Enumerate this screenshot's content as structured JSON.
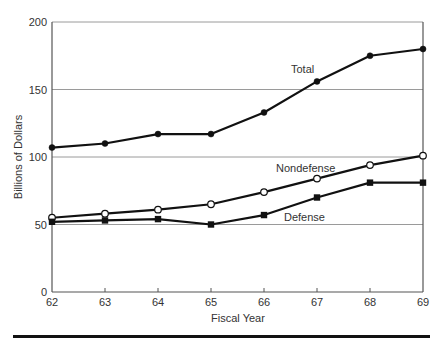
{
  "chart_data": {
    "type": "line",
    "title": "",
    "xlabel": "Fiscal Year",
    "ylabel": "Billions of Dollars",
    "x": [
      "62",
      "63",
      "64",
      "65",
      "66",
      "67",
      "68",
      "69"
    ],
    "ylim": [
      0,
      200
    ],
    "yticks": [
      "0",
      "50",
      "100",
      "150",
      "200"
    ],
    "grid": "horizontal",
    "legend": "inline labels",
    "series": [
      {
        "name": "Total",
        "marker": "filled-circle",
        "values": [
          107,
          110,
          117,
          117,
          133,
          156,
          175,
          180
        ]
      },
      {
        "name": "Nondefense",
        "marker": "open-circle",
        "values": [
          55,
          58,
          61,
          65,
          74,
          84,
          94,
          101
        ]
      },
      {
        "name": "Defense",
        "marker": "filled-square",
        "values": [
          52,
          53,
          54,
          50,
          57,
          70,
          81,
          81
        ]
      }
    ]
  },
  "labels": {
    "ylabel": "Billions of Dollars",
    "xlabel": "Fiscal Year",
    "total": "Total",
    "nondefense": "Nondefense",
    "defense": "Defense",
    "y0": "0",
    "y50": "50",
    "y100": "100",
    "y150": "150",
    "y200": "200",
    "x62": "62",
    "x63": "63",
    "x64": "64",
    "x65": "65",
    "x66": "66",
    "x67": "67",
    "x68": "68",
    "x69": "69"
  }
}
